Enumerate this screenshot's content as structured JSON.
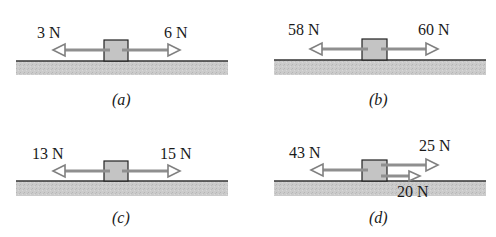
{
  "colors": {
    "ground_fill": "#c8c8c8",
    "ground_line": "#333333",
    "block_fill": "#c4c4c4",
    "block_stroke": "#222222",
    "arrow_shaft": "#8f8f8f",
    "arrow_outline": "#808080",
    "text": "#1a1a1a"
  },
  "panels": [
    {
      "id": "a",
      "caption": "(a)",
      "forces": [
        {
          "label": "3 N",
          "magnitude": 3,
          "direction": "left"
        },
        {
          "label": "6 N",
          "magnitude": 6,
          "direction": "right"
        }
      ]
    },
    {
      "id": "b",
      "caption": "(b)",
      "forces": [
        {
          "label": "58 N",
          "magnitude": 58,
          "direction": "left"
        },
        {
          "label": "60 N",
          "magnitude": 60,
          "direction": "right"
        }
      ]
    },
    {
      "id": "c",
      "caption": "(c)",
      "forces": [
        {
          "label": "13 N",
          "magnitude": 13,
          "direction": "left"
        },
        {
          "label": "15 N",
          "magnitude": 15,
          "direction": "right"
        }
      ]
    },
    {
      "id": "d",
      "caption": "(d)",
      "forces": [
        {
          "label": "43 N",
          "magnitude": 43,
          "direction": "left"
        },
        {
          "label": "25 N",
          "magnitude": 25,
          "direction": "right"
        },
        {
          "label": "20 N",
          "magnitude": 20,
          "direction": "right"
        }
      ]
    }
  ]
}
